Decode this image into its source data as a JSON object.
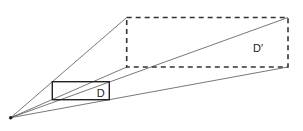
{
  "diagram": {
    "type": "perspective-projection",
    "origin": {
      "x": 10.7,
      "y": 117.7
    },
    "original_rect": {
      "label": "D",
      "x": 52.3,
      "y": 81.7,
      "width": 57,
      "height": 18,
      "style": "solid"
    },
    "projected_rect": {
      "label": "D′",
      "x": 126.7,
      "y": 17.5,
      "width": 161.3,
      "height": 49.5,
      "style": "dashed"
    },
    "projection_lines": [
      {
        "to": "top-left",
        "x2": 126.7,
        "y2": 17.5
      },
      {
        "to": "top-right",
        "x2": 288,
        "y2": 17.5
      },
      {
        "to": "bottom-left",
        "x2": 126.7,
        "y2": 67
      },
      {
        "to": "bottom-right",
        "x2": 288,
        "y2": 67
      }
    ],
    "labels": {
      "small": "D",
      "large": "D′"
    },
    "colors": {
      "stroke": "#333333",
      "line": "#555555",
      "background": "#ffffff"
    }
  }
}
